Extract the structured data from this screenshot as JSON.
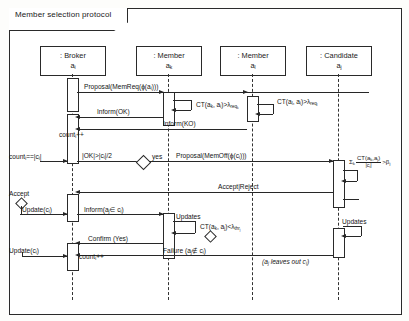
{
  "frame": {
    "label": "Member selection protocol"
  },
  "lifelines": [
    {
      "name": ": Broker",
      "id": "a_i"
    },
    {
      "name": ": Member",
      "id": "a_k"
    },
    {
      "name": ": Member",
      "id": "a_l"
    },
    {
      "name": ": Candidate",
      "id": "a_j"
    }
  ],
  "messages": [
    {
      "label": "Proposal(MemReq(ϕ(a_i)))"
    },
    {
      "label": "Inform(OK)"
    },
    {
      "label": "Inform(KO)"
    },
    {
      "label": "Proposal(MemOff(ϕ(c_i)))"
    },
    {
      "label": "Accept|Reject"
    },
    {
      "label": "Inform(a_j ∈ c_i)"
    },
    {
      "label": "Confirm (Yes)"
    },
    {
      "label": "Failure (a_j ∉ c_i)"
    },
    {
      "label": "Updates"
    },
    {
      "label": "Updates"
    }
  ],
  "guards": [
    {
      "label": "CT(a_k, a_i)>λ_req_k"
    },
    {
      "label": "CT(a_l, a_i)>λ_req_l"
    },
    {
      "label": "CT(a_k, a_j)<λ_thr_j"
    }
  ],
  "actions": [
    {
      "label": "count_i++"
    },
    {
      "label": "count_i==|c_i|"
    },
    {
      "label": "Update(c_i)"
    },
    {
      "label": "Update(c_i)"
    },
    {
      "label": "count_i++"
    }
  ],
  "decisions": [
    {
      "label": "|OK|>|c_i|/2",
      "branch": "yes"
    },
    {
      "label": "Accept"
    }
  ],
  "notes": [
    {
      "label": "(a_j leaves out c_i)"
    }
  ],
  "formula": {
    "sigma": "Σ_k",
    "numerator": "CT(a_k,a_j)",
    "denominator": "|c_i|",
    "comparator": ">β_j"
  },
  "symbols": {
    "phi": "ϕ",
    "lambda": "λ",
    "beta": "β",
    "sigma": "Σ",
    "in": "∈",
    "notin": "∉"
  },
  "colors": {
    "line": "#272727",
    "frame": "#2a2a2a",
    "paper": "#ffffff"
  }
}
